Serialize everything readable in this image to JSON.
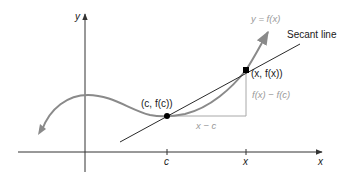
{
  "diagram": {
    "colors": {
      "axis": "#333333",
      "curve": "#8a8a8a",
      "secant": "#2a2a2a",
      "triangle": "#a8a8a8",
      "gray_label": "#9a9a9a",
      "point": "#000000"
    },
    "labels": {
      "y_axis": "y",
      "x_axis": "x",
      "curve": "y = f(x)",
      "secant": "Secant line",
      "point_x": "(x, f(x))",
      "point_c": "(c, f(c))",
      "rise": "f(x) − f(c)",
      "run": "x − c",
      "tick_c": "c",
      "tick_x": "x"
    },
    "points": [
      {
        "name": "(c, f(c))",
        "px": 167,
        "py": 116
      },
      {
        "name": "(x, f(x))",
        "px": 246,
        "py": 70
      }
    ]
  }
}
